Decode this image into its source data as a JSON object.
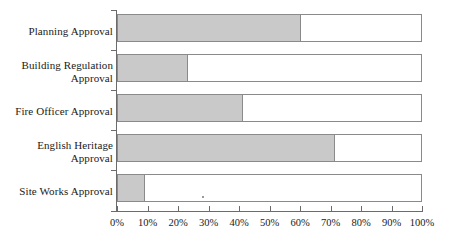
{
  "chart_data": {
    "type": "bar",
    "orientation": "horizontal",
    "title": "",
    "subtitle": "",
    "xlabel": "",
    "ylabel": "",
    "categories": [
      "Planning Approval",
      "Building Regulation Approval",
      "Fire Officer Approval",
      "English Heritage Approval",
      "Site Works Approval"
    ],
    "category_lines": [
      [
        "Planning Approval"
      ],
      [
        "Building Regulation",
        "Approval"
      ],
      [
        "Fire Officer Approval"
      ],
      [
        "English Heritage",
        "Approval"
      ],
      [
        "Site Works Approval"
      ]
    ],
    "values": [
      60,
      23,
      41,
      71,
      9
    ],
    "remainders": [
      40,
      77,
      59,
      29,
      91
    ],
    "xlim": [
      0,
      100
    ],
    "unit": "%",
    "tick_values": [
      0,
      10,
      20,
      30,
      40,
      50,
      60,
      70,
      80,
      90,
      100
    ],
    "tick_labels": [
      "0%",
      "10%",
      "20%",
      "30%",
      "40%",
      "50%",
      "60%",
      "70%",
      "80%",
      "90%",
      "100%"
    ],
    "grid": false,
    "legend": null,
    "series": [
      {
        "name": "filled",
        "values": [
          60,
          23,
          41,
          71,
          9
        ],
        "color": "#c9c9c9"
      },
      {
        "name": "remainder",
        "values": [
          40,
          77,
          59,
          29,
          91
        ],
        "color": "#ffffff"
      }
    ],
    "colors": {
      "fill": "#c9c9c9",
      "empty": "#ffffff",
      "border": "#8a8a8a",
      "axis": "#6b6b6b",
      "text": "#1a1a1a",
      "background": "#ffffff"
    }
  }
}
